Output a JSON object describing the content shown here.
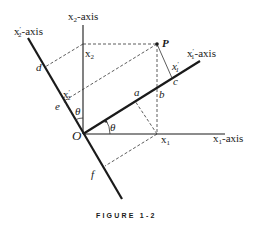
{
  "figure": {
    "caption": "FIGURE 1-2",
    "axes": {
      "x1": "x",
      "x1_sub": "1",
      "x1_suffix": "-axis",
      "x2": "x",
      "x2_sub": "2",
      "x2_suffix": "-axis",
      "x1p": "x",
      "x1p_prime": "′",
      "x1p_sub": "1",
      "x1p_suffix": "-axis",
      "x2p": "x",
      "x2p_prime": "′",
      "x2p_sub": "2",
      "x2p_suffix": "-axis"
    },
    "points": {
      "origin": "O",
      "P": "P",
      "a": "a",
      "b": "b",
      "c": "c",
      "d": "d",
      "e": "e",
      "f": "f"
    },
    "coordinates": {
      "x1": "x",
      "x1_sub": "1",
      "x2": "x",
      "x2_sub": "2",
      "x1p": "x",
      "x1p_prime": "′",
      "x1p_sub": "1",
      "x2p": "x",
      "x2p_prime": "′",
      "x2p_sub": "2"
    },
    "angles": {
      "theta_upper": "θ",
      "theta_lower": "θ"
    }
  }
}
